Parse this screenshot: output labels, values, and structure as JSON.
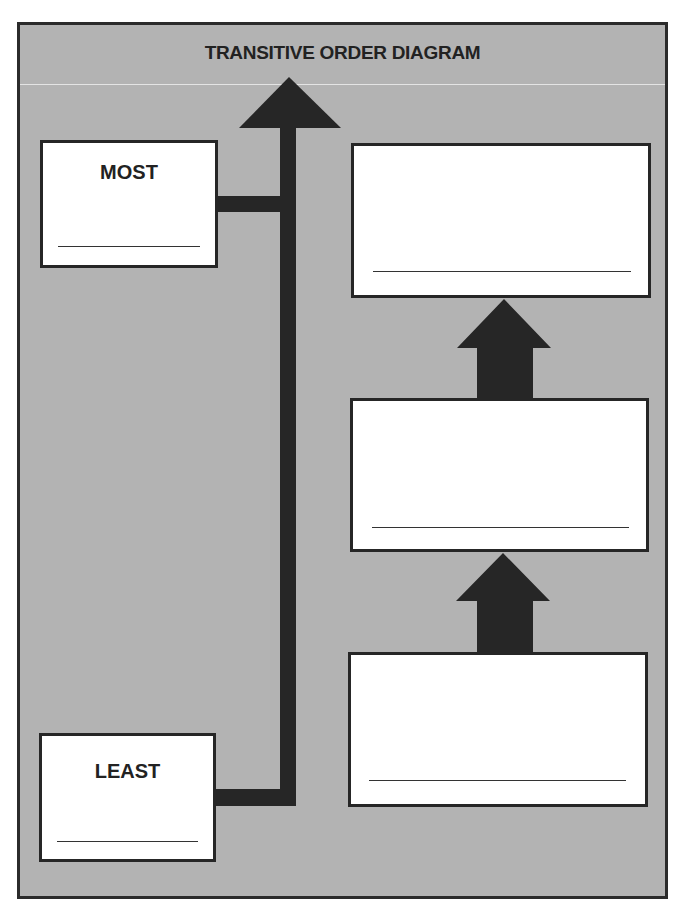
{
  "title": "TRANSITIVE ORDER DIAGRAM",
  "colors": {
    "background": "#b3b3b3",
    "box_fill": "#ffffff",
    "stroke": "#262626"
  },
  "scale": {
    "top_label": "MOST",
    "bottom_label": "LEAST",
    "top_answer": "",
    "bottom_answer": ""
  },
  "order_boxes": [
    {
      "position": "top",
      "answer": ""
    },
    {
      "position": "middle",
      "answer": ""
    },
    {
      "position": "bottom",
      "answer": ""
    }
  ],
  "icons": {
    "scale_arrow": "up-arrow-icon",
    "order_arrows": [
      "up-arrow-icon",
      "up-arrow-icon"
    ]
  }
}
